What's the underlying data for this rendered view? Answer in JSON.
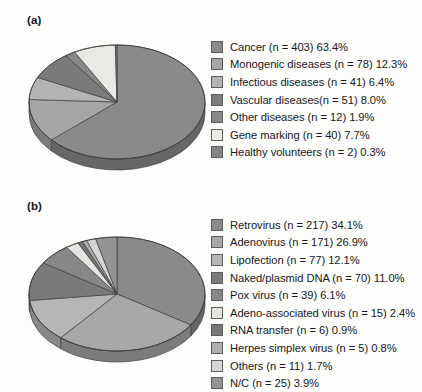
{
  "figure": {
    "background": "#fdfdfc",
    "style": "grayscale 3D pie charts"
  },
  "panels": [
    {
      "id": "a",
      "label": "(a)",
      "legend": [
        {
          "label": "Cancer (n = 403) 63.4%",
          "color": "#8a8a8a"
        },
        {
          "label": "Monogenic diseases (n = 78) 12.3%",
          "color": "#a6a6a6"
        },
        {
          "label": "Infectious diseases (n = 41) 6.4%",
          "color": "#b4b4b4"
        },
        {
          "label": "Vascular diseases(n = 51) 8.0%",
          "color": "#7b7b7b"
        },
        {
          "label": "Other diseases (n = 12) 1.9%",
          "color": "#888888"
        },
        {
          "label": "Gene marking (n = 40) 7.7%",
          "color": "#e9e9e6"
        },
        {
          "label": "Healthy volunteers (n = 2) 0.3%",
          "color": "#848484"
        }
      ]
    },
    {
      "id": "b",
      "label": "(b)",
      "legend": [
        {
          "label": "Retrovirus (n = 217) 34.1%",
          "color": "#8a8a8a"
        },
        {
          "label": "Adenovirus (n = 171) 26.9%",
          "color": "#a8a8a8"
        },
        {
          "label": "Lipofection (n = 77) 12.1%",
          "color": "#b6b6b6"
        },
        {
          "label": "Naked/plasmid DNA (n = 70) 11.0%",
          "color": "#7a7a7a"
        },
        {
          "label": "Pox virus (n = 39) 6.1%",
          "color": "#878787"
        },
        {
          "label": "Adeno-associated virus (n = 15) 2.4%",
          "color": "#e4e4e1"
        },
        {
          "label": "RNA transfer (n = 6) 0.9%",
          "color": "#767676"
        },
        {
          "label": "Herpes simplex virus (n = 5) 0.8%",
          "color": "#b0b0b0"
        },
        {
          "label": "Others (n = 11) 1.7%",
          "color": "#d6d6d4"
        },
        {
          "label": "N/C (n = 25) 3.9%",
          "color": "#939393"
        }
      ]
    }
  ],
  "chart_data": [
    {
      "type": "pie",
      "title": "(a)",
      "labels": [
        "Cancer",
        "Monogenic diseases",
        "Infectious diseases",
        "Vascular diseases",
        "Other diseases",
        "Gene marking",
        "Healthy volunteers"
      ],
      "counts": [
        403,
        78,
        41,
        51,
        12,
        40,
        2
      ],
      "values": [
        63.4,
        12.3,
        6.4,
        8.0,
        1.9,
        7.7,
        0.3
      ],
      "unit": "%",
      "colors": [
        "#8a8a8a",
        "#a6a6a6",
        "#b4b4b4",
        "#7b7b7b",
        "#888888",
        "#e9e9e6",
        "#848484"
      ],
      "legend_position": "right",
      "three_d": true,
      "start_angle_deg": -90,
      "direction": "clockwise"
    },
    {
      "type": "pie",
      "title": "(b)",
      "labels": [
        "Retrovirus",
        "Adenovirus",
        "Lipofection",
        "Naked/plasmid DNA",
        "Pox virus",
        "Adeno-associated virus",
        "RNA transfer",
        "Herpes simplex virus",
        "Others",
        "N/C"
      ],
      "counts": [
        217,
        171,
        77,
        70,
        39,
        15,
        6,
        5,
        11,
        25
      ],
      "values": [
        34.1,
        26.9,
        12.1,
        11.0,
        6.1,
        2.4,
        0.9,
        0.8,
        1.7,
        3.9
      ],
      "unit": "%",
      "colors": [
        "#8a8a8a",
        "#a8a8a8",
        "#b6b6b6",
        "#7a7a7a",
        "#878787",
        "#e4e4e1",
        "#767676",
        "#b0b0b0",
        "#d6d6d4",
        "#939393"
      ],
      "legend_position": "right",
      "three_d": true,
      "start_angle_deg": -90,
      "direction": "clockwise"
    }
  ]
}
